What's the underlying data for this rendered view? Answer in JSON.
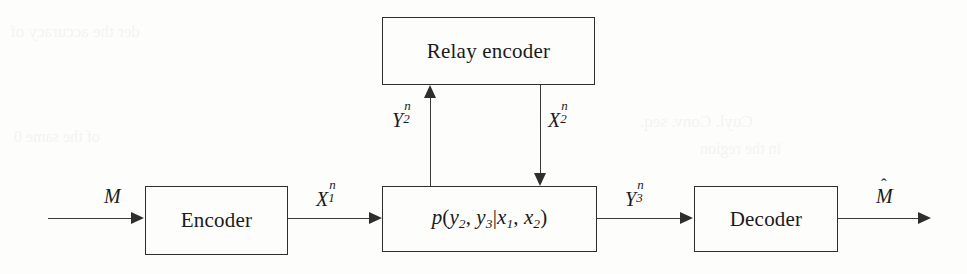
{
  "figure": {
    "type": "block-diagram",
    "name": "relay-channel-block-diagram",
    "background_color": "#fdfdfb",
    "line_color": "#2e2e2e"
  },
  "blocks": {
    "relay_encoder": {
      "label": "Relay encoder",
      "x": 382,
      "y": 17,
      "width": 213,
      "height": 68
    },
    "encoder": {
      "label": "Encoder",
      "x": 145,
      "y": 186,
      "width": 143,
      "height": 69
    },
    "channel": {
      "label_plain": "p(y2, y3|x1, x2)",
      "p": "p",
      "open_paren": "(",
      "y2": "y",
      "y2_sub": "2",
      "comma1": ", ",
      "y3": "y",
      "y3_sub": "3",
      "bar": "|",
      "x1": "x",
      "x1_sub": "1",
      "comma2": ", ",
      "x2": "x",
      "x2_sub": "2",
      "close_paren": ")",
      "x": 382,
      "y": 186,
      "width": 215,
      "height": 66
    },
    "decoder": {
      "label": "Decoder",
      "x": 694,
      "y": 186,
      "width": 144,
      "height": 66
    }
  },
  "signals": {
    "message_in": {
      "base": "M",
      "sup": "",
      "sub": "",
      "x": 104,
      "y": 186
    },
    "x1n": {
      "base": "X",
      "sub": "1",
      "sup": "n",
      "x": 316,
      "y": 186
    },
    "y2n": {
      "base": "Y",
      "sub": "2",
      "sup": "n",
      "x": 392,
      "y": 107
    },
    "x2n": {
      "base": "X",
      "sub": "2",
      "sup": "n",
      "x": 548,
      "y": 107
    },
    "y3n": {
      "base": "Y",
      "sub": "3",
      "sup": "n",
      "x": 625,
      "y": 186
    },
    "message_out": {
      "base": "M",
      "hat": "ˆ",
      "sup": "",
      "sub": "",
      "x": 876,
      "y": 186
    }
  },
  "connections": [
    {
      "name": "input-to-encoder",
      "from": "message-source",
      "to": "encoder",
      "direction": "right"
    },
    {
      "name": "encoder-to-channel",
      "from": "encoder",
      "to": "channel",
      "direction": "right",
      "signal": "X1n"
    },
    {
      "name": "channel-to-relay",
      "from": "channel",
      "to": "relay_encoder",
      "direction": "up",
      "signal": "Y2n"
    },
    {
      "name": "relay-to-channel",
      "from": "relay_encoder",
      "to": "channel",
      "direction": "down",
      "signal": "X2n"
    },
    {
      "name": "channel-to-decoder",
      "from": "channel",
      "to": "decoder",
      "direction": "right",
      "signal": "Y3n"
    },
    {
      "name": "decoder-to-output",
      "from": "decoder",
      "to": "message-sink",
      "direction": "right",
      "signal": "Mhat"
    }
  ],
  "bleed_through": {
    "line1": "der the accuracy of",
    "line2": "of the same 0",
    "line3": "Cuyl. Conv. seq.",
    "line4": "in the region"
  }
}
